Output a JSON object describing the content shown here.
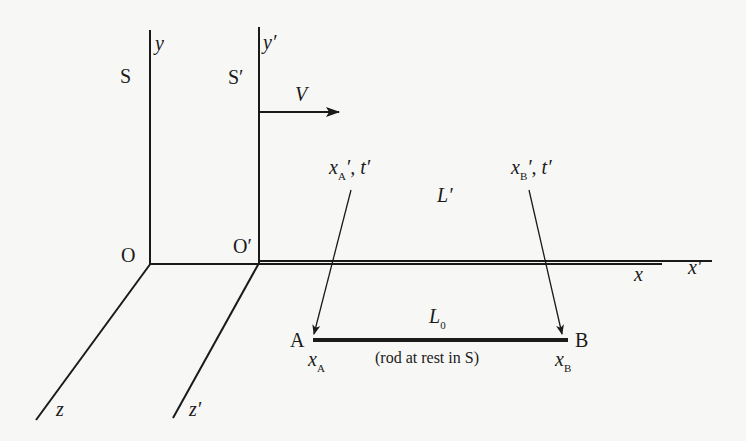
{
  "diagram": {
    "frames": {
      "S": {
        "label": "S",
        "origin": "O",
        "y_axis": "y",
        "x_axis": "x",
        "z_axis": "z"
      },
      "S_prime": {
        "label": "S′",
        "origin": "O′",
        "y_axis": "y′",
        "x_axis": "x′",
        "z_axis": "z′"
      }
    },
    "velocity": {
      "label": "V"
    },
    "events": {
      "A": {
        "var": "x",
        "sub": "A",
        "suffix": "′, t′"
      },
      "B": {
        "var": "x",
        "sub": "B",
        "suffix": "′, t′"
      }
    },
    "length_moving": {
      "var": "L",
      "suffix": "′"
    },
    "length_rest": {
      "var": "L",
      "sub": "0"
    },
    "rod": {
      "end_A": "A",
      "end_B": "B",
      "pos_A": {
        "var": "x",
        "sub": "A"
      },
      "pos_B": {
        "var": "x",
        "sub": "B"
      },
      "caption": "(rod at rest in S)"
    },
    "colors": {
      "ink": "#1a1a1a",
      "paper": "#f7f7f5"
    }
  }
}
